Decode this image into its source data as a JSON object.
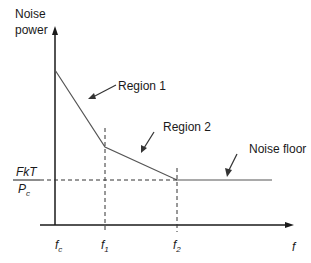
{
  "diagram": {
    "y_axis_label_line1": "Noise",
    "y_axis_label_line2": "power",
    "x_axis_label": "f",
    "y_level_numerator": "FkT",
    "y_level_denominator_main": "P",
    "y_level_denominator_sub": "c",
    "annotations": {
      "region1": "Region 1",
      "region2": "Region 2",
      "noise_floor": "Noise floor"
    },
    "x_ticks": [
      {
        "main": "f",
        "sub": "c"
      },
      {
        "main": "f",
        "sub": "1"
      },
      {
        "main": "f",
        "sub": "2"
      }
    ],
    "colors": {
      "axis": "#1a1a1a",
      "curve": "#555555",
      "dashed": "#333333"
    }
  }
}
